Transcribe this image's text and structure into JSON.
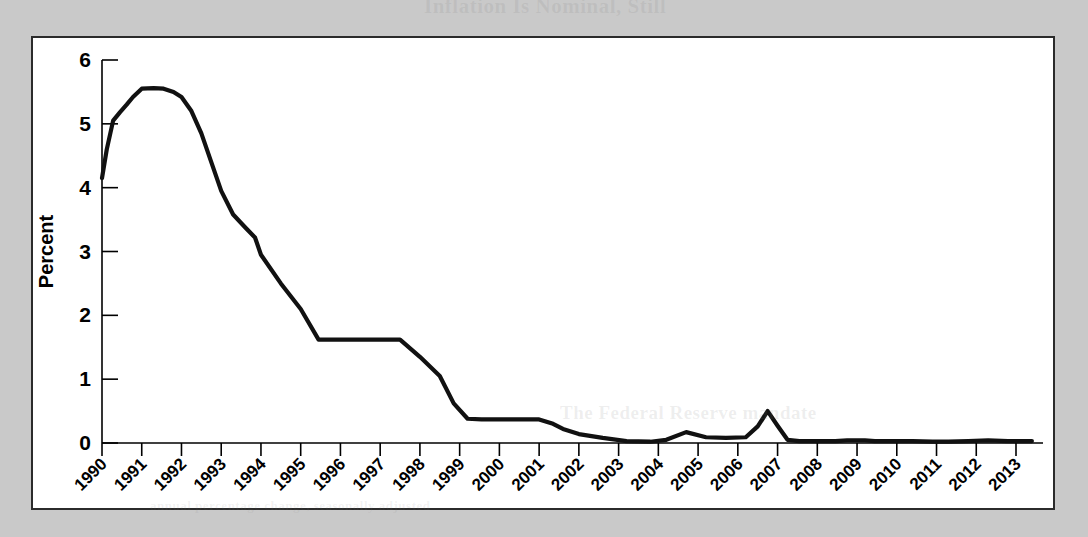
{
  "page": {
    "background_color": "#c9c9c9",
    "panel_background": "#ffffff",
    "panel_border_color": "#2b2b2b",
    "line_color": "#111111"
  },
  "bleed_through": {
    "top_text": "Inflation Is Nominal, Still",
    "middle_text": "The Federal Reserve mandate",
    "bottom_text": "annual percentage change, seasonally adjusted"
  },
  "chart_data": {
    "type": "line",
    "title": "",
    "xlabel": "",
    "ylabel": "Percent",
    "ylim": [
      0,
      6
    ],
    "xlim": [
      1990,
      2013.4
    ],
    "yticks": [
      "0",
      "1",
      "2",
      "3",
      "4",
      "5",
      "6"
    ],
    "ytick_values": [
      0,
      1,
      2,
      3,
      4,
      5,
      6
    ],
    "grid": false,
    "legend": "none",
    "categories": [
      "1990",
      "1991",
      "1992",
      "1993",
      "1994",
      "1995",
      "1996",
      "1997",
      "1998",
      "1999",
      "2000",
      "2001",
      "2002",
      "2003",
      "2004",
      "2005",
      "2006",
      "2007",
      "2008",
      "2009",
      "2010",
      "2011",
      "2012",
      "2013"
    ],
    "series": [
      {
        "name": "Percent",
        "x": [
          1990.0,
          1990.12,
          1990.28,
          1990.45,
          1990.62,
          1990.78,
          1991.0,
          1991.3,
          1991.55,
          1991.8,
          1992.0,
          1992.25,
          1992.5,
          1992.75,
          1993.0,
          1993.3,
          1993.6,
          1993.85,
          1994.0,
          1994.5,
          1995.0,
          1995.45,
          1995.6,
          1995.85,
          1996.0,
          1996.5,
          1997.0,
          1997.5,
          1998.0,
          1998.5,
          1998.85,
          1999.2,
          1999.55,
          1999.85,
          2000.0,
          2000.2,
          2000.45,
          2000.7,
          2001.0,
          2001.35,
          2001.6,
          2002.0,
          2002.6,
          2003.2,
          2003.8,
          2004.2,
          2004.7,
          2005.2,
          2005.7,
          2006.2,
          2006.5,
          2006.75,
          2007.0,
          2007.25,
          2007.55,
          2007.8,
          2008.0,
          2008.2,
          2008.45,
          2008.75,
          2009.0,
          2009.2,
          2009.45,
          2009.7,
          2010.0,
          2010.4,
          2010.9,
          2011.3,
          2011.8,
          2012.3,
          2012.8,
          2013.2,
          2013.4
        ],
        "values": [
          4.15,
          4.6,
          5.05,
          5.18,
          5.3,
          5.42,
          5.55,
          5.56,
          5.55,
          5.5,
          5.42,
          5.2,
          4.85,
          4.4,
          3.95,
          3.58,
          3.38,
          3.22,
          2.95,
          2.5,
          2.1,
          1.62,
          1.62,
          1.62,
          1.62,
          1.62,
          1.62,
          1.62,
          1.35,
          1.05,
          0.62,
          0.38,
          0.37,
          0.37,
          0.37,
          0.37,
          0.37,
          0.37,
          0.37,
          0.3,
          0.22,
          0.14,
          0.08,
          0.03,
          0.02,
          0.05,
          0.17,
          0.09,
          0.08,
          0.09,
          0.26,
          0.5,
          0.27,
          0.05,
          0.03,
          0.03,
          0.03,
          0.03,
          0.03,
          0.04,
          0.04,
          0.04,
          0.03,
          0.03,
          0.03,
          0.03,
          0.02,
          0.02,
          0.03,
          0.04,
          0.03,
          0.03,
          0.03
        ]
      }
    ],
    "annotations": {
      "start_value": 4.15,
      "peak_value": 5.55,
      "peak_year": "1991",
      "plateau_1994_1995": 1.62,
      "plateau_1996_1998": 0.37,
      "bump_2000": 0.17,
      "spike_2001": 0.5,
      "bump_2008_peak": 0.62,
      "end_value": 0.1
    }
  }
}
